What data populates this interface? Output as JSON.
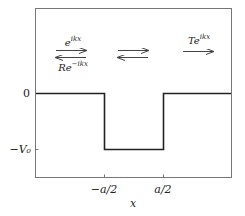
{
  "diagram": {
    "y_axis": {
      "ticks": [
        {
          "value": 0,
          "label": "0"
        },
        {
          "value": -1,
          "label": "−V₀"
        }
      ]
    },
    "x_axis": {
      "label": "x",
      "ticks": [
        {
          "value": -0.5,
          "label": "−a/2"
        },
        {
          "value": 0.5,
          "label": "a/2"
        }
      ]
    },
    "potential": {
      "description": "V(x) = 0 for |x| > a/2, V(x) = -V0 for |x| < a/2",
      "segments": [
        {
          "x": [
            -1.17,
            -0.5
          ],
          "V": 0
        },
        {
          "x": [
            -0.5,
            0.5
          ],
          "V": -1
        },
        {
          "x": [
            0.5,
            1.17
          ],
          "V": 0
        }
      ]
    },
    "waves": {
      "incident": {
        "label_base": "e",
        "label_exp": "ikx",
        "direction": "right"
      },
      "reflected": {
        "label_base": "Re",
        "label_exp": "−ikx",
        "direction": "left"
      },
      "inside_right": {
        "label": "",
        "direction": "right"
      },
      "inside_left": {
        "label": "",
        "direction": "left"
      },
      "transmitted": {
        "label_base": "Te",
        "label_exp": "ikx",
        "direction": "right"
      }
    },
    "colors": {
      "line": "#222222",
      "frame": "#666666",
      "arrow": "#444444"
    }
  }
}
